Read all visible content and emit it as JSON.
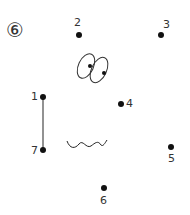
{
  "worksheet": {
    "puzzle_number": "⑥",
    "dots": [
      {
        "label": "1",
        "x": 43,
        "y": 97
      },
      {
        "label": "2",
        "x": 79,
        "y": 35
      },
      {
        "label": "3",
        "x": 161,
        "y": 35
      },
      {
        "label": "4",
        "x": 121,
        "y": 104
      },
      {
        "label": "5",
        "x": 171,
        "y": 147
      },
      {
        "label": "6",
        "x": 104,
        "y": 188
      },
      {
        "label": "7",
        "x": 43,
        "y": 150
      }
    ],
    "connected_line": {
      "from": "1",
      "to": "7"
    },
    "colors": {
      "ink": "#111111",
      "line": "#777777",
      "label": "#333333"
    }
  }
}
